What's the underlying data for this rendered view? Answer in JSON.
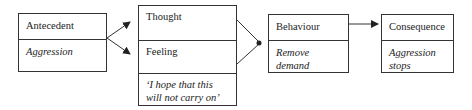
{
  "diagram": {
    "antecedent": {
      "header": "Antecedent",
      "body": "Aggression"
    },
    "thought_feeling": {
      "thought": "Thought",
      "feeling": "Feeling",
      "quote": "‘I hope that this will not carry on’"
    },
    "behaviour": {
      "header": "Behaviour",
      "body": "Remove demand"
    },
    "consequence": {
      "header": "Consequence",
      "body": "Aggression stops"
    },
    "colors": {
      "line": "#333333",
      "background": "#ffffff"
    }
  }
}
